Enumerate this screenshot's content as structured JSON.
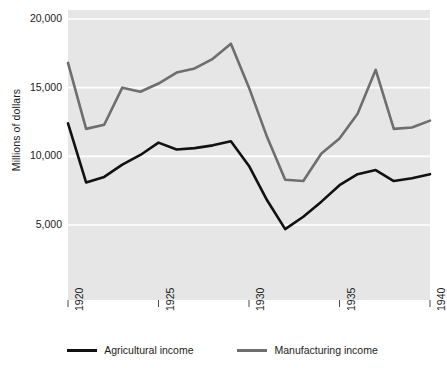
{
  "chart_data": {
    "type": "line",
    "title": "",
    "xlabel": "",
    "ylabel": "Millions of dollars",
    "x": [
      1920,
      1921,
      1922,
      1923,
      1924,
      1925,
      1926,
      1927,
      1928,
      1929,
      1930,
      1931,
      1932,
      1933,
      1934,
      1935,
      1936,
      1937,
      1938,
      1939,
      1940
    ],
    "xlim": [
      1920,
      1940
    ],
    "ylim": [
      0,
      20000
    ],
    "yticks": [
      5000,
      10000,
      15000,
      20000
    ],
    "ytick_labels": [
      "5,000",
      "10,000",
      "15,000",
      "20,000"
    ],
    "xticks": [
      1920,
      1925,
      1930,
      1935,
      1940
    ],
    "xtick_labels": [
      "1920",
      "1925",
      "1930",
      "1935",
      "1940"
    ],
    "grid": true,
    "grid_color": "#ffffff",
    "plot_background": "#e6e6e6",
    "legend_position": "below",
    "series": [
      {
        "name": "Agricultural income",
        "color": "#111111",
        "values": [
          12400,
          8100,
          8500,
          9400,
          10100,
          11000,
          10500,
          10600,
          10800,
          11100,
          9300,
          6800,
          4700,
          5600,
          6700,
          7900,
          8700,
          9000,
          8200,
          8400,
          8700
        ]
      },
      {
        "name": "Manufacturing income",
        "color": "#6e6e6e",
        "values": [
          16800,
          12000,
          12300,
          15000,
          14700,
          15300,
          16100,
          16400,
          17100,
          18200,
          15000,
          11400,
          8300,
          8200,
          10200,
          11300,
          13100,
          16300,
          12000,
          12100,
          12600
        ]
      }
    ]
  },
  "legend": {
    "entries": [
      {
        "label": "Agricultural income",
        "color": "#111111"
      },
      {
        "label": "Manufacturing income",
        "color": "#6e6e6e"
      }
    ]
  }
}
